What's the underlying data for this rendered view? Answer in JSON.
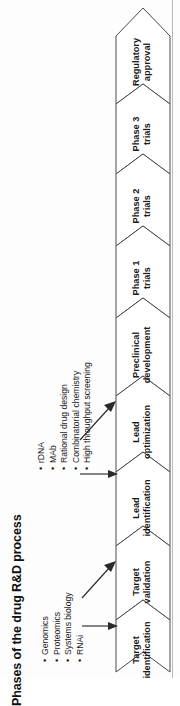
{
  "title": "Phases of the drug R&D process",
  "diagram": {
    "type": "process-flow-chevrons",
    "orientation": "vertical-rotated",
    "phases": [
      {
        "id": "target-identification",
        "line1": "Target",
        "line2": "identification"
      },
      {
        "id": "target-validation",
        "line1": "Target",
        "line2": "validation"
      },
      {
        "id": "lead-identification",
        "line1": "Lead",
        "line2": "identification"
      },
      {
        "id": "lead-optimization",
        "line1": "Lead",
        "line2": "optimization"
      },
      {
        "id": "preclinical-development",
        "line1": "Preclinical",
        "line2": "development"
      },
      {
        "id": "phase-1-trials",
        "line1": "Phase 1",
        "line2": "trials"
      },
      {
        "id": "phase-2-trials",
        "line1": "Phase 2",
        "line2": "trials"
      },
      {
        "id": "phase-3-trials",
        "line1": "Phase 3",
        "line2": "trials"
      },
      {
        "id": "regulatory-approval",
        "line1": "Regulatory",
        "line2": "approval"
      }
    ]
  },
  "annotations": {
    "discovery_technologies": {
      "id": "discovery-technologies",
      "bullet": "•",
      "items": [
        "Genomics",
        "Proteomics",
        "Systems biology",
        "RNAi"
      ],
      "targets": [
        "target-identification",
        "target-validation"
      ]
    },
    "lead_technologies": {
      "id": "lead-technologies",
      "bullet": "•",
      "items": [
        "rDNA",
        "MAb",
        "Rational drug design",
        "Combinatorial chemistry",
        "High throughput screening"
      ],
      "targets": [
        "lead-identification",
        "lead-optimization"
      ]
    }
  },
  "colors": {
    "chevron_fill": "#ffffff",
    "chevron_stroke": "#4a4a4a",
    "text": "#1a1a1a",
    "arrow": "#2a2a2a",
    "frame_line": "#b9b9b9",
    "background": "#fdfdfd"
  }
}
